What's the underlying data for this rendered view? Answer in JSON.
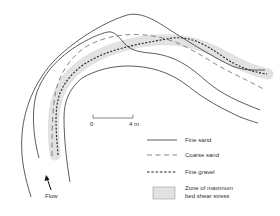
{
  "diagram": {
    "title": "",
    "scale_bar": {
      "start_label": "0",
      "end_label": "4 m"
    },
    "flow_label": "Flow",
    "legend": [
      {
        "key": "fine_sand",
        "label": "Fine sand",
        "style": "solid"
      },
      {
        "key": "coarse_sand",
        "label": "Coarse sand",
        "style": "dashed"
      },
      {
        "key": "fine_gravel",
        "label": "Fine gravel",
        "style": "dotted"
      },
      {
        "key": "zone",
        "label_line1": "Zone of maximum",
        "label_line2": "bed shear stress",
        "style": "shaded-box"
      }
    ],
    "colors": {
      "line": "#333333",
      "zone_fill": "#e2e2e2",
      "zone_stroke": "#999999",
      "background": "#ffffff"
    }
  }
}
